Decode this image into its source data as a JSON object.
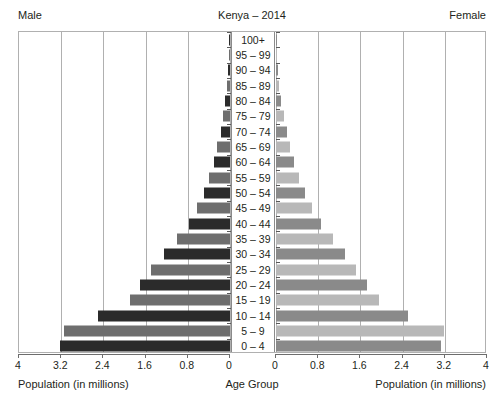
{
  "header": {
    "male_label": "Male",
    "female_label": "Female",
    "title": "Kenya – 2014"
  },
  "footer": {
    "left_axis_title": "Population (in millions)",
    "center_axis_title": "Age Group",
    "right_axis_title": "Population (in millions)"
  },
  "axis": {
    "left_ticks": [
      "4",
      "3.2",
      "2.4",
      "1.6",
      "0.8",
      "0"
    ],
    "right_ticks": [
      "0",
      "0.8",
      "1.6",
      "2.4",
      "3.2",
      "4"
    ]
  },
  "chart_data": {
    "type": "bar",
    "title": "Kenya – 2014",
    "subtitle": "",
    "xlabel": "Population (in millions)",
    "ylabel": "Age Group",
    "orientation": "horizontal",
    "layout": "population-pyramid",
    "xlim": [
      0,
      4
    ],
    "xticks": [
      0,
      0.8,
      1.6,
      2.4,
      3.2,
      4
    ],
    "grid": true,
    "legend": "none",
    "categories": [
      "100+",
      "95 – 99",
      "90 – 94",
      "85 – 89",
      "80 – 84",
      "75 – 79",
      "70 – 74",
      "65 – 69",
      "60 – 64",
      "55 – 59",
      "50 – 54",
      "45 – 49",
      "40 – 44",
      "35 – 39",
      "30 – 34",
      "25 – 29",
      "20 – 24",
      "15 – 19",
      "10 – 14",
      "5 – 9",
      "0 – 4"
    ],
    "series": [
      {
        "name": "Male",
        "side": "left",
        "colors": [
          "#2b2b2b",
          "#6e6e6e"
        ],
        "values": [
          0.01,
          0.02,
          0.03,
          0.05,
          0.09,
          0.13,
          0.17,
          0.24,
          0.3,
          0.4,
          0.5,
          0.62,
          0.78,
          1.0,
          1.25,
          1.5,
          1.7,
          1.9,
          2.5,
          3.15,
          3.22
        ]
      },
      {
        "name": "Female",
        "side": "right",
        "colors": [
          "#8a8a8a",
          "#b8b8b8"
        ],
        "values": [
          0.01,
          0.02,
          0.03,
          0.05,
          0.1,
          0.15,
          0.21,
          0.27,
          0.35,
          0.44,
          0.55,
          0.68,
          0.85,
          1.08,
          1.3,
          1.52,
          1.72,
          1.95,
          2.5,
          3.18,
          3.12
        ]
      }
    ]
  }
}
